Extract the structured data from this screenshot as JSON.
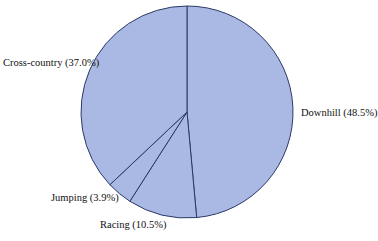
{
  "chart_data": {
    "type": "pie",
    "title": "",
    "subtitle": "",
    "xlabel": "",
    "ylabel": "",
    "legend_position": "none",
    "grid": false,
    "start_angle_deg": 0,
    "direction": "clockwise",
    "categories": [
      "Downhill",
      "Racing",
      "Jumping",
      "Cross-country"
    ],
    "values": [
      48.5,
      10.5,
      3.9,
      37.0
    ],
    "labels": [
      "Downhill (48.5%)",
      "Racing (10.5%)",
      "Jumping (3.9%)",
      "Cross-country (37.0%)"
    ],
    "slices": [
      {
        "name": "Downhill",
        "percent": 48.5,
        "label": "Downhill (48.5%)",
        "label_position": "right"
      },
      {
        "name": "Racing",
        "percent": 10.5,
        "label": "Racing (10.5%)",
        "label_position": "bottom"
      },
      {
        "name": "Jumping",
        "percent": 3.9,
        "label": "Jumping (3.9%)",
        "label_position": "bottom-left"
      },
      {
        "name": "Cross-country",
        "percent": 37.0,
        "label": "Cross-country (37.0%)",
        "label_position": "left"
      }
    ],
    "colors": {
      "slice_fill": "#aab9e3",
      "slice_stroke": "#2b3a66",
      "background": "#ffffff",
      "label_text": "#111111"
    },
    "geometry": {
      "center_x": 187,
      "center_y": 112,
      "radius": 106
    }
  }
}
